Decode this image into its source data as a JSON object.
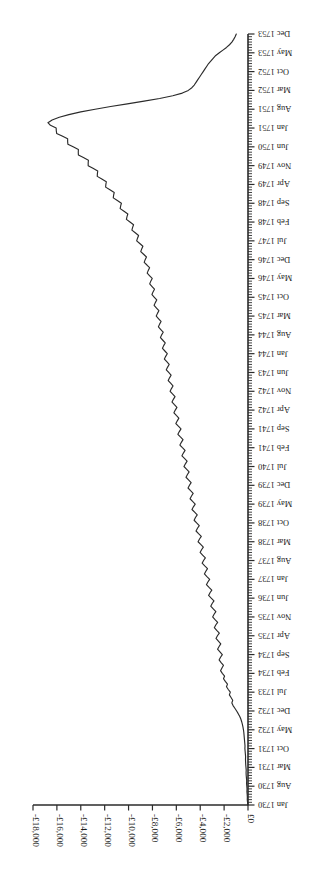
{
  "chart_data": {
    "type": "line",
    "title": "",
    "subtitle": "",
    "xlabel": "",
    "ylabel": "",
    "orientation": "rotated-180",
    "grid": false,
    "legend": "none",
    "currency_symbol": "£",
    "series_color": "#2b2b2b",
    "axis_color": "#2b2b2b",
    "background_color": "#ffffff",
    "xlim": [
      "Jan 1730",
      "Dec 1753"
    ],
    "ylim": [
      -18000,
      0
    ],
    "ytick_labels": [
      "£0",
      "-£2,000",
      "-£4,000",
      "-£6,000",
      "-£8,000",
      "-£10,000",
      "-£12,000",
      "-£14,000",
      "-£16,000",
      "-£18,000"
    ],
    "ytick_values": [
      0,
      -2000,
      -4000,
      -6000,
      -8000,
      -10000,
      -12000,
      -14000,
      -16000,
      -18000
    ],
    "xtick_labels": [
      "Jan 1730",
      "Aug 1730",
      "Mar 1731",
      "Oct 1731",
      "May 1732",
      "Dec 1732",
      "Jul 1733",
      "Feb 1734",
      "Sep 1734",
      "Apr 1735",
      "Nov 1735",
      "Jun 1736",
      "Jan 1737",
      "Aug 1737",
      "Mar 1738",
      "Oct 1738",
      "May 1739",
      "Dec 1739",
      "Jul 1740",
      "Feb 1741",
      "Sep 1741",
      "Apr 1742",
      "Nov 1742",
      "Jun 1743",
      "Jan 1744",
      "Aug 1744",
      "Mar 1745",
      "Oct 1745",
      "May 1746",
      "Dec 1746",
      "Jul 1747",
      "Feb 1748",
      "Sep 1748",
      "Apr 1749",
      "Nov 1749",
      "Jun 1750",
      "Jan 1751",
      "Aug 1751",
      "Mar 1752",
      "Oct 1752",
      "May 1753",
      "Dec 1753"
    ],
    "xtick_label_interval_months": 7,
    "minor_tick_interval_months": 1,
    "total_months": 288,
    "x_start_label": "Jan 1730",
    "x_end_label": "Dec 1753",
    "values": [
      0,
      -40,
      -60,
      -55,
      -70,
      -90,
      -80,
      -100,
      -120,
      -110,
      -130,
      -150,
      -160,
      -150,
      -170,
      -190,
      -200,
      -210,
      -200,
      -220,
      -240,
      -260,
      -250,
      -270,
      -290,
      -310,
      -330,
      -350,
      -380,
      -420,
      -470,
      -530,
      -600,
      -700,
      -820,
      -950,
      -1100,
      -1250,
      -1350,
      -1280,
      -1420,
      -1560,
      -1480,
      -1650,
      -1800,
      -1720,
      -1900,
      -2050,
      -1960,
      -2150,
      -2300,
      -2180,
      -2050,
      -2250,
      -2420,
      -2300,
      -2150,
      -2350,
      -2550,
      -2420,
      -2280,
      -2480,
      -2680,
      -2560,
      -2400,
      -2620,
      -2820,
      -2700,
      -2540,
      -2760,
      -2960,
      -2840,
      -2690,
      -2910,
      -3120,
      -3000,
      -2850,
      -3080,
      -3300,
      -3180,
      -3030,
      -3260,
      -3480,
      -3360,
      -3210,
      -3440,
      -3650,
      -3530,
      -3390,
      -3620,
      -3840,
      -3720,
      -3570,
      -3800,
      -4010,
      -3890,
      -3740,
      -3960,
      -4180,
      -4060,
      -3910,
      -4140,
      -4350,
      -4230,
      -4080,
      -4300,
      -4510,
      -4400,
      -4250,
      -4470,
      -4690,
      -4570,
      -4420,
      -4640,
      -4850,
      -4730,
      -4590,
      -4810,
      -5020,
      -4900,
      -4760,
      -4980,
      -5190,
      -5070,
      -4930,
      -5150,
      -5360,
      -5240,
      -5100,
      -5320,
      -5530,
      -5410,
      -5270,
      -5490,
      -5700,
      -5580,
      -5440,
      -5660,
      -5870,
      -5750,
      -5610,
      -5830,
      -6040,
      -5920,
      -5790,
      -6000,
      -6200,
      -6090,
      -5950,
      -6160,
      -6360,
      -6250,
      -6110,
      -6320,
      -6520,
      -6410,
      -6280,
      -6480,
      -6680,
      -6570,
      -6440,
      -6640,
      -6840,
      -6730,
      -6600,
      -6800,
      -7000,
      -6890,
      -6760,
      -6960,
      -7160,
      -7060,
      -6930,
      -7130,
      -7330,
      -7230,
      -7100,
      -7300,
      -7500,
      -7400,
      -7280,
      -7480,
      -7680,
      -7580,
      -7460,
      -7660,
      -7860,
      -7760,
      -7640,
      -7840,
      -8040,
      -7950,
      -7830,
      -8030,
      -8230,
      -8140,
      -8020,
      -8230,
      -8440,
      -8350,
      -8240,
      -8460,
      -8690,
      -8610,
      -8500,
      -8740,
      -8980,
      -8900,
      -8800,
      -9060,
      -9320,
      -9250,
      -9160,
      -9440,
      -9720,
      -9660,
      -9580,
      -9880,
      -10180,
      -10130,
      -10060,
      -10380,
      -10700,
      -10660,
      -10600,
      -10940,
      -11280,
      -11250,
      -11200,
      -11560,
      -11920,
      -11900,
      -11860,
      -12240,
      -12620,
      -12610,
      -12580,
      -12980,
      -13380,
      -13380,
      -13360,
      -13780,
      -14200,
      -14210,
      -14200,
      -14640,
      -15080,
      -15100,
      -15100,
      -15560,
      -16020,
      -16050,
      -16060,
      -16540,
      -16750,
      -16400,
      -15800,
      -15000,
      -14000,
      -12800,
      -11500,
      -10100,
      -8700,
      -7400,
      -6300,
      -5500,
      -5000,
      -4700,
      -4500,
      -4350,
      -4200,
      -4050,
      -3900,
      -3750,
      -3600,
      -3450,
      -3300,
      -3100,
      -2900,
      -2700,
      -2400,
      -2100,
      -1800,
      -1550,
      -1350,
      -1200,
      -1080,
      -980
    ],
    "annotations": [
      {
        "label": "Peak deficit near Aug 1751",
        "value": -16750,
        "x_label": "Aug 1751"
      },
      {
        "label": "Recovery toward Dec 1753",
        "value": -980,
        "x_label": "Dec 1753"
      },
      {
        "label": "Series starts at zero",
        "value": 0,
        "x_label": "Jan 1730"
      }
    ]
  },
  "figure": {
    "name": "balance-over-time-line-chart",
    "rotation_degrees": 180
  }
}
